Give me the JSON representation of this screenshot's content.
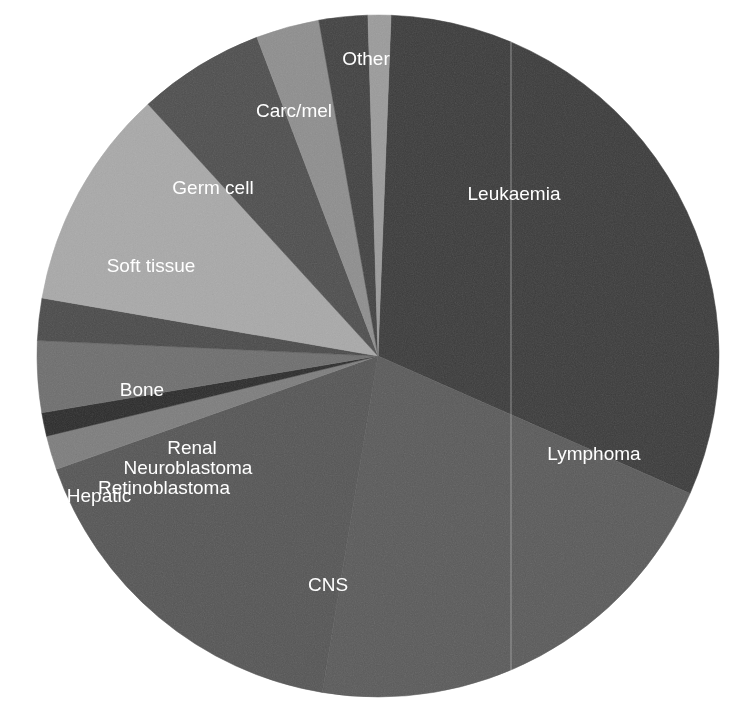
{
  "figure": {
    "title": "",
    "background_color": "#ffffff",
    "center_x": 378,
    "center_y": 356,
    "radius": 341,
    "label_color": "#ffffff",
    "scan_artifact_x": 511
  },
  "chart_data": {
    "type": "pie",
    "title": "",
    "xlabel": "",
    "ylabel": "",
    "legend_position": "none",
    "labels_inside_slices": true,
    "start_angle_deg": 0,
    "direction": "clockwise",
    "categories": [
      "Leukaemia",
      "Lymphoma",
      "CNS",
      "Retinoblastoma",
      "Hepatic",
      "Neuroblastoma",
      "Renal",
      "Bone",
      "Soft tissue",
      "Germ cell",
      "Carc/mel",
      "Other"
    ],
    "values": [
      31.0,
      21.0,
      17.0,
      1.6,
      1.1,
      3.4,
      2.0,
      10.5,
      6.0,
      3.0,
      2.3,
      1.1
    ],
    "units": "percent",
    "slices": [
      {
        "label": "Leukaemia",
        "value": 31.0,
        "color": "#3b3b3b",
        "start_deg": 2.2,
        "end_deg": 113.8,
        "label_x": 514,
        "label_y": 195
      },
      {
        "label": "Lymphoma",
        "value": 21.0,
        "color": "#5a5a5a",
        "start_deg": 113.8,
        "end_deg": 189.4,
        "label_x": 594,
        "label_y": 455
      },
      {
        "label": "CNS",
        "value": 17.0,
        "color": "#555555",
        "start_deg": 189.4,
        "end_deg": 250.6,
        "label_x": 328,
        "label_y": 586
      },
      {
        "label": "Retinoblastoma",
        "value": 1.6,
        "color": "#7d7d7d",
        "start_deg": 250.6,
        "end_deg": 256.4,
        "label_x": 164,
        "label_y": 489
      },
      {
        "label": "Hepatic",
        "value": 1.1,
        "color": "#2b2b2b",
        "start_deg": 256.4,
        "end_deg": 260.4,
        "label_x": 99,
        "label_y": 497
      },
      {
        "label": "Neuroblastoma",
        "value": 3.4,
        "color": "#6e6e6e",
        "start_deg": 260.4,
        "end_deg": 272.6,
        "label_x": 188,
        "label_y": 469
      },
      {
        "label": "Renal",
        "value": 2.0,
        "color": "#4a4a4a",
        "start_deg": 272.6,
        "end_deg": 279.8,
        "label_x": 192,
        "label_y": 449
      },
      {
        "label": "Bone",
        "value": 10.5,
        "color": "#a9a9a9",
        "start_deg": 279.8,
        "end_deg": 317.6,
        "label_x": 142,
        "label_y": 391
      },
      {
        "label": "Soft tissue",
        "value": 6.0,
        "color": "#4e4e4e",
        "start_deg": 317.6,
        "end_deg": 339.2,
        "label_x": 151,
        "label_y": 267
      },
      {
        "label": "Germ cell",
        "value": 3.0,
        "color": "#8e8e8e",
        "start_deg": 339.2,
        "end_deg": 350.0,
        "label_x": 213,
        "label_y": 189
      },
      {
        "label": "Carc/mel",
        "value": 2.3,
        "color": "#414141",
        "start_deg": 350.0,
        "end_deg": 358.3,
        "label_x": 294,
        "label_y": 112
      },
      {
        "label": "Other",
        "value": 1.1,
        "color": "#9b9b9b",
        "start_deg": 358.3,
        "end_deg": 362.2,
        "label_x": 366,
        "label_y": 60
      }
    ]
  }
}
